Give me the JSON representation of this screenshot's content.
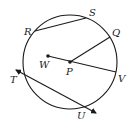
{
  "diagram": {
    "type": "circle-geometry",
    "circle": {
      "cx": 70,
      "cy": 62,
      "r": 47
    },
    "points": {
      "R": {
        "x": 35,
        "y": 31,
        "label": "R",
        "lx": 24,
        "ly": 35
      },
      "S": {
        "x": 86,
        "y": 18,
        "label": "S",
        "lx": 89,
        "ly": 16
      },
      "Q": {
        "x": 110,
        "y": 37,
        "label": "Q",
        "lx": 112,
        "ly": 36
      },
      "W": {
        "x": 48,
        "y": 56,
        "label": "W",
        "lx": 39,
        "ly": 68
      },
      "P": {
        "x": 70,
        "y": 62,
        "label": "P",
        "lx": 66,
        "ly": 75
      },
      "V": {
        "x": 116,
        "y": 72,
        "label": "V",
        "lx": 118,
        "ly": 82
      },
      "T": {
        "x": 24,
        "y": 75,
        "label": "T",
        "lx": 10,
        "ly": 83
      },
      "U": {
        "x": 82,
        "y": 106,
        "label": "U",
        "lx": 77,
        "ly": 119
      }
    },
    "segments": [
      {
        "name": "chord-RS",
        "from": "R",
        "to": "S"
      },
      {
        "name": "radius-PQ",
        "from": "P",
        "to": "Q"
      },
      {
        "name": "segment-WV",
        "from": "W",
        "to": "V"
      }
    ],
    "lines": [
      {
        "name": "secant-TU",
        "x1": 16,
        "y1": 70,
        "x2": 96,
        "y2": 113,
        "arrows": "both"
      }
    ],
    "dots": [
      "W",
      "P"
    ]
  },
  "labels": {
    "R": "R",
    "S": "S",
    "Q": "Q",
    "W": "W",
    "P": "P",
    "V": "V",
    "T": "T",
    "U": "U"
  }
}
